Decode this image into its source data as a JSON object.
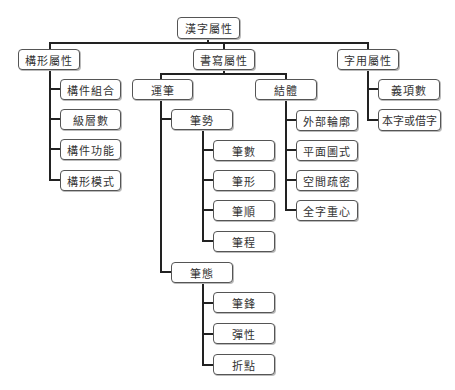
{
  "diagram": {
    "root": {
      "label": "漢字屬性"
    },
    "branches": {
      "formation": {
        "label": "構形屬性",
        "children": [
          "構件組合",
          "級層數",
          "構件功能",
          "構形模式"
        ]
      },
      "writing": {
        "label": "書寫屬性",
        "yunbi": {
          "label": "運筆",
          "bishi": {
            "label": "筆勢",
            "children": [
              "筆數",
              "筆形",
              "筆順",
              "筆程"
            ]
          },
          "bitai": {
            "label": "筆態",
            "children": [
              "筆鋒",
              "彈性",
              "折點"
            ]
          }
        },
        "jieti": {
          "label": "結體",
          "children": [
            "外部輪廓",
            "平面圖式",
            "空間疏密",
            "全字重心"
          ]
        }
      },
      "usage": {
        "label": "字用屬性",
        "children": [
          "義項數",
          "本字或借字"
        ]
      }
    }
  }
}
